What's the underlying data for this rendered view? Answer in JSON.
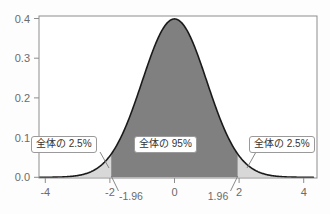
{
  "figure": {
    "background_color": "#fdfdfd",
    "frame_color": "#8d8d8d",
    "curve_color": "#1a1a1a",
    "center_fill_color": "#808080",
    "tail_fill_color": "#d8d8d8"
  },
  "annotations": {
    "left_tail_label": "全体の 2.5%",
    "center_label": "全体の 95%",
    "right_tail_label": "全体の 2.5%"
  },
  "axis": {
    "y_ticks": [
      "0.4",
      "0.3",
      "0.2",
      "0.1",
      "0.0"
    ],
    "x_ticks": [
      "-4",
      "-2",
      "0",
      "2",
      "4"
    ],
    "x_extra_ticks": [
      "-1.96",
      "1.96"
    ]
  },
  "chart_data": {
    "type": "area",
    "title": "",
    "subtitle": "",
    "xlabel": "",
    "ylabel": "",
    "xlim": [
      -4.3,
      4.3
    ],
    "ylim": [
      0.0,
      0.42
    ],
    "grid": false,
    "legend_position": "none",
    "distribution": "standard normal (mean 0, sd 1)",
    "peak_value": 0.3989,
    "x_tick_values": [
      -4,
      -2,
      0,
      2,
      4
    ],
    "x_tick_labels": [
      "-4",
      "-2",
      "0",
      "2",
      "4"
    ],
    "y_tick_values": [
      0.0,
      0.1,
      0.2,
      0.3,
      0.4
    ],
    "y_tick_labels": [
      "0.0",
      "0.1",
      "0.2",
      "0.3",
      "0.4"
    ],
    "annotated_x_values": [
      -1.96,
      1.96
    ],
    "annotated_x_labels": [
      "-1.96",
      "1.96"
    ],
    "regions": [
      {
        "name": "left-tail",
        "x_range": [
          -4.3,
          -1.96
        ],
        "label": "全体の 2.5%",
        "area": 0.025,
        "fill": "#d8d8d8"
      },
      {
        "name": "center",
        "x_range": [
          -1.96,
          1.96
        ],
        "label": "全体の 95%",
        "area": 0.95,
        "fill": "#808080"
      },
      {
        "name": "right-tail",
        "x_range": [
          1.96,
          4.3
        ],
        "label": "全体の 2.5%",
        "area": 0.025,
        "fill": "#d8d8d8"
      }
    ],
    "series": [
      {
        "name": "standard normal pdf",
        "x": [
          -4.3,
          -4.0,
          -3.5,
          -3.0,
          -2.5,
          -2.0,
          -1.96,
          -1.5,
          -1.0,
          -0.5,
          0.0,
          0.5,
          1.0,
          1.5,
          1.96,
          2.0,
          2.5,
          3.0,
          3.5,
          4.0,
          4.3
        ],
        "values": [
          0.0001,
          0.0001,
          0.0009,
          0.0044,
          0.0175,
          0.054,
          0.0584,
          0.1295,
          0.242,
          0.3521,
          0.3989,
          0.3521,
          0.242,
          0.1295,
          0.0584,
          0.054,
          0.0175,
          0.0044,
          0.0009,
          0.0001,
          0.0001
        ]
      }
    ]
  }
}
